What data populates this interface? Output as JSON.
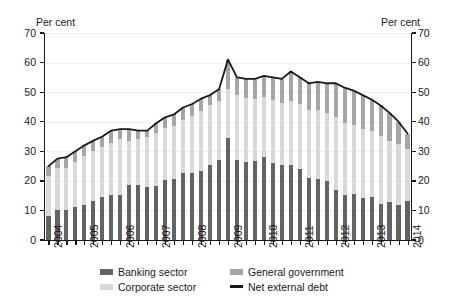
{
  "axis_unit_left": "Per cent",
  "axis_unit_right": "Per cent",
  "legend": [
    {
      "key": "banking",
      "label": "Banking sector",
      "color": "#636363",
      "marker": "swatch"
    },
    {
      "key": "govt",
      "label": "General government",
      "color": "#a6a6a6",
      "marker": "swatch"
    },
    {
      "key": "corporate",
      "label": "Corporate sector",
      "color": "#d9d9d9",
      "marker": "swatch"
    },
    {
      "key": "net",
      "label": "Net external debt",
      "color": "#1a1a1a",
      "marker": "line"
    }
  ],
  "chart_data": {
    "type": "bar",
    "title": "",
    "subtitle": "",
    "xlabel": "",
    "ylabel": "Per cent",
    "ylabel_right": "Per cent",
    "ylim": [
      0,
      70
    ],
    "yticks": [
      0,
      10,
      20,
      30,
      40,
      50,
      60,
      70
    ],
    "ytick_labels": [
      "0",
      "10",
      "20",
      "30",
      "40",
      "50",
      "60",
      "70"
    ],
    "grid": true,
    "legend_position": "bottom",
    "stacked": true,
    "x_tick_frequency": "quarterly",
    "x_label_frequency": "annual",
    "categories": [
      "2004 Q1",
      "2004 Q2",
      "2004 Q3",
      "2004 Q4",
      "2005 Q1",
      "2005 Q2",
      "2005 Q3",
      "2005 Q4",
      "2006 Q1",
      "2006 Q2",
      "2006 Q3",
      "2006 Q4",
      "2007 Q1",
      "2007 Q2",
      "2007 Q3",
      "2007 Q4",
      "2008 Q1",
      "2008 Q2",
      "2008 Q3",
      "2008 Q4",
      "2009 Q1",
      "2009 Q2",
      "2009 Q3",
      "2009 Q4",
      "2010 Q1",
      "2010 Q2",
      "2010 Q3",
      "2010 Q4",
      "2011 Q1",
      "2011 Q2",
      "2011 Q3",
      "2011 Q4",
      "2012 Q1",
      "2012 Q2",
      "2012 Q3",
      "2012 Q4",
      "2013 Q1",
      "2013 Q2",
      "2013 Q3",
      "2013 Q4",
      "2014 Q1"
    ],
    "x_axis_labels": [
      "2004",
      "2005",
      "2006",
      "2007",
      "2008",
      "2009",
      "2010",
      "2011",
      "2012",
      "2013",
      "2014"
    ],
    "series": [
      {
        "name": "Banking sector",
        "color": "#636363",
        "values": [
          8.0,
          10.2,
          10.0,
          11.0,
          11.8,
          13.2,
          14.5,
          15.2,
          15.2,
          18.6,
          18.5,
          17.8,
          18.2,
          20.4,
          20.5,
          22.8,
          22.8,
          23.2,
          25.5,
          27.0,
          34.5,
          27.0,
          26.5,
          26.8,
          28.2,
          26.0,
          25.5,
          25.2,
          24.0,
          21.0,
          20.6,
          19.8,
          17.0,
          15.2,
          15.4,
          14.2,
          14.4,
          12.2,
          13.0,
          12.0,
          13.2
        ]
      },
      {
        "name": "Corporate sector",
        "color": "#d9d9d9",
        "values": [
          13.5,
          14.0,
          14.5,
          15.5,
          16.6,
          17.0,
          17.0,
          17.5,
          18.8,
          14.8,
          15.5,
          17.0,
          18.0,
          17.5,
          18.2,
          17.8,
          19.0,
          20.5,
          20.0,
          20.0,
          16.5,
          22.0,
          21.5,
          21.0,
          20.2,
          21.5,
          21.0,
          21.8,
          22.0,
          23.0,
          23.5,
          23.0,
          24.5,
          24.5,
          23.5,
          23.5,
          22.5,
          23.0,
          20.5,
          20.5,
          17.5
        ]
      },
      {
        "name": "General government",
        "color": "#a6a6a6",
        "values": [
          3.5,
          3.3,
          3.5,
          3.5,
          3.6,
          3.4,
          3.5,
          4.3,
          3.5,
          4.1,
          3.0,
          2.2,
          3.3,
          3.6,
          3.8,
          4.2,
          4.2,
          4.1,
          3.5,
          4.0,
          10.0,
          6.0,
          6.5,
          6.7,
          7.1,
          7.5,
          8.0,
          10.0,
          9.0,
          9.0,
          9.4,
          10.2,
          11.5,
          11.8,
          11.6,
          11.3,
          10.6,
          10.3,
          9.5,
          7.5,
          5.3
        ]
      }
    ],
    "line_series": {
      "name": "Net external debt",
      "color": "#1a1a1a",
      "values": [
        25.0,
        27.5,
        28.0,
        30.0,
        32.0,
        33.6,
        35.0,
        37.0,
        37.5,
        37.5,
        37.0,
        37.0,
        39.5,
        41.5,
        42.5,
        44.8,
        46.0,
        47.8,
        49.0,
        51.0,
        61.0,
        55.0,
        54.5,
        54.5,
        55.5,
        55.0,
        54.5,
        57.0,
        55.0,
        53.0,
        53.5,
        53.0,
        53.0,
        51.5,
        50.5,
        49.0,
        47.5,
        45.5,
        43.0,
        40.0,
        36.0
      ]
    }
  }
}
